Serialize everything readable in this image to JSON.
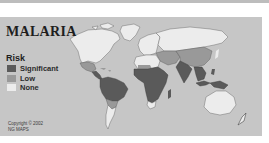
{
  "map": {
    "title": "MALARIA",
    "legend": {
      "heading": "Risk",
      "items": [
        {
          "label": "Significant",
          "color": "#5a5a5a"
        },
        {
          "label": "Low",
          "color": "#999999"
        },
        {
          "label": "None",
          "color": "#ececec"
        }
      ]
    },
    "credit": {
      "line1": "Copyright © 2002",
      "line2": "NG MAPS"
    },
    "colors": {
      "ocean": "#c6c6c6",
      "significant": "#5a5a5a",
      "low": "#999999",
      "none": "#ececec"
    },
    "regions": {
      "significant": [
        "Central America",
        "Northern South America",
        "Sub-Saharan Africa",
        "India",
        "Southeast Asia",
        "Indonesia",
        "Papua New Guinea"
      ],
      "low": [
        "Mexico",
        "Southern Brazil",
        "North Africa (parts)",
        "China",
        "Middle East",
        "Southern Africa"
      ],
      "none": [
        "North America",
        "Greenland",
        "Europe",
        "Russia",
        "Southern South America",
        "Australia",
        "New Zealand"
      ]
    }
  }
}
